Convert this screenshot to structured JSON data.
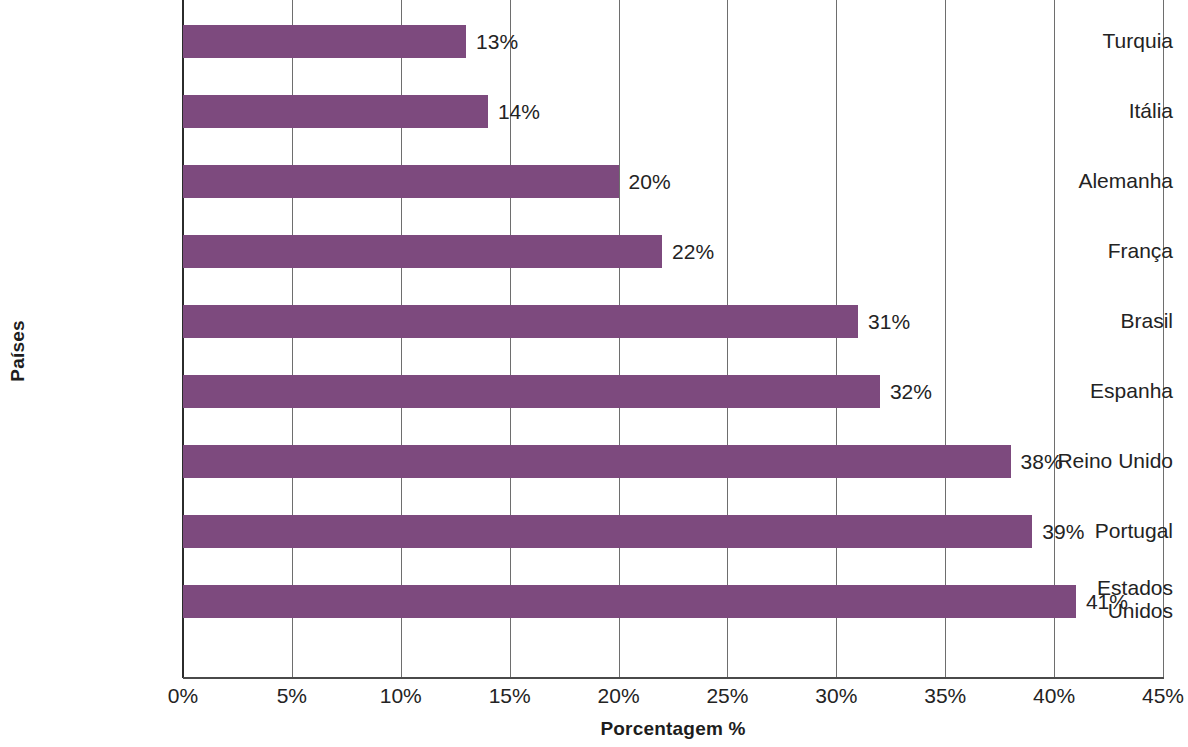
{
  "chart_data": {
    "type": "bar",
    "orientation": "horizontal",
    "title": "",
    "xlabel": "Porcentagem %",
    "ylabel": "Países",
    "categories": [
      "Turquia",
      "Itália",
      "Alemanha",
      "França",
      "Brasil",
      "Espanha",
      "Reino Unido",
      "Portugal",
      "Estados Unidos"
    ],
    "values": [
      13,
      14,
      20,
      22,
      31,
      32,
      38,
      39,
      41
    ],
    "data_labels": [
      "13%",
      "14%",
      "20%",
      "22%",
      "31%",
      "32%",
      "38%",
      "39%",
      "41%"
    ],
    "xlim": [
      0,
      45
    ],
    "xticks": [
      0,
      5,
      10,
      15,
      20,
      25,
      30,
      35,
      40,
      45
    ],
    "xtick_labels": [
      "0%",
      "5%",
      "10%",
      "15%",
      "20%",
      "25%",
      "30%",
      "35%",
      "40%",
      "45%"
    ],
    "grid": "vertical",
    "legend": "none",
    "bar_color": "#7d4a7e",
    "gridline_color": "#6e6e6e",
    "axis_color": "#2b2b2b",
    "background": "#ffffff"
  }
}
